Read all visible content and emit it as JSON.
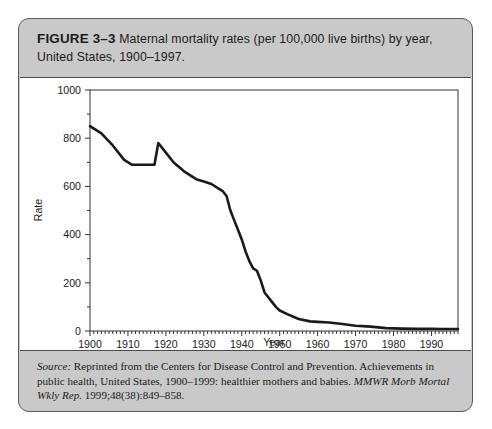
{
  "figure": {
    "label": "FIGURE 3–3",
    "title_line1": "Maternal mortality rates (per 100,000 live births) by year,",
    "title_line2": "United States, 1900–1997.",
    "source_label": "Source:",
    "source_text_1": " Reprinted from the Centers for Disease Control and Prevention. Achievements in public health, United States, 1900–1999: healthier mothers and babies. ",
    "source_journal": "MMWR Morb Mortal Wkly Rep.",
    "source_text_2": " 1999;48(38):849–858."
  },
  "chart_data": {
    "type": "line",
    "title": "Maternal mortality rates (per 100,000 live births) by year, United States, 1900–1997",
    "xlabel": "Year",
    "ylabel": "Rate",
    "xlim": [
      1900,
      1997
    ],
    "ylim": [
      0,
      1000
    ],
    "grid": false,
    "legend": null,
    "x_ticks": [
      1900,
      1910,
      1920,
      1930,
      1940,
      1950,
      1960,
      1970,
      1980,
      1990
    ],
    "x_tick_labels": [
      "1900",
      "1910",
      "1920",
      "1930",
      "1940",
      "1950",
      "1960",
      "1970",
      "1980",
      "1990"
    ],
    "x_minor_tick_step": 1,
    "y_ticks": [
      0,
      200,
      400,
      600,
      800,
      1000
    ],
    "y_tick_labels": [
      "0",
      "200",
      "400",
      "600",
      "800",
      "1000"
    ],
    "y_minor_tick_step": 100,
    "line_color": "#1a1a1a",
    "line_width": 2.6,
    "series": [
      {
        "name": "Maternal mortality rate",
        "x": [
          1900,
          1903,
          1906,
          1909,
          1911,
          1913,
          1915,
          1917,
          1918,
          1920,
          1922,
          1925,
          1928,
          1930,
          1932,
          1934,
          1935,
          1936,
          1937,
          1938,
          1939,
          1940,
          1941,
          1942,
          1943,
          1944,
          1945,
          1946,
          1947,
          1948,
          1949,
          1950,
          1952,
          1955,
          1958,
          1960,
          1963,
          1966,
          1970,
          1974,
          1978,
          1982,
          1986,
          1990,
          1993,
          1997
        ],
        "y": [
          850,
          820,
          770,
          710,
          690,
          690,
          690,
          690,
          780,
          740,
          700,
          660,
          630,
          620,
          610,
          590,
          580,
          560,
          500,
          460,
          420,
          380,
          330,
          290,
          260,
          250,
          210,
          160,
          140,
          120,
          100,
          85,
          70,
          50,
          40,
          38,
          35,
          30,
          22,
          18,
          12,
          10,
          9,
          9,
          8,
          8
        ]
      }
    ]
  }
}
